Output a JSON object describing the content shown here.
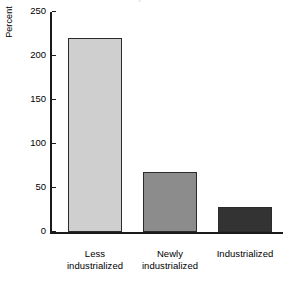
{
  "figure": {
    "cropped_title": "Percent distribution by level of industrialization",
    "background_color": "#ffffff"
  },
  "chart_data": {
    "type": "bar",
    "title": "",
    "xlabel": "",
    "ylabel": "Percent",
    "categories": [
      "Less industrialized",
      "Newly industrialized",
      "Industrialized"
    ],
    "category_lines": [
      [
        "Less",
        "industrialized"
      ],
      [
        "Newly",
        "industrialized"
      ],
      [
        "Industrialized"
      ]
    ],
    "values": [
      220,
      68,
      28
    ],
    "bar_colors": [
      "#cfcfcf",
      "#8c8c8c",
      "#333333"
    ],
    "bar_edge_color": "#2b2b2b",
    "ylim": [
      0,
      250
    ],
    "yticks": [
      0,
      50,
      100,
      150,
      200,
      250
    ],
    "ytick_labels": [
      "0",
      "50",
      "100",
      "150",
      "200",
      "250"
    ],
    "grid": false,
    "legend": null
  }
}
